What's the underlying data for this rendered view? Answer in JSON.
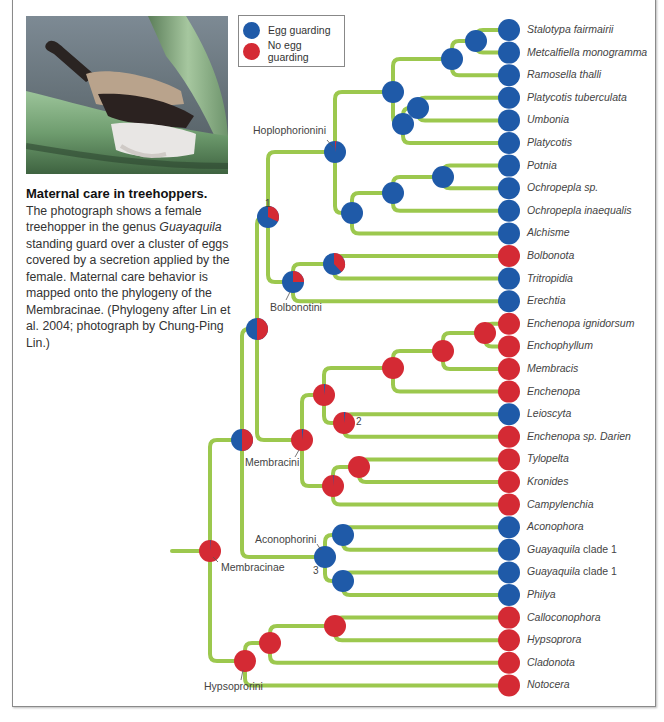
{
  "legend": {
    "items": [
      {
        "label": "Egg guarding",
        "color": "#1f5aa8"
      },
      {
        "label": "No egg guarding",
        "color": "#d42a34"
      }
    ]
  },
  "colors": {
    "egg_guarding": "#1f5aa8",
    "no_egg_guarding": "#d42a34",
    "branch": "#9cc84e"
  },
  "caption": {
    "title": "Maternal care in treehoppers.",
    "body_1": "The photograph shows a female treehopper in the genus ",
    "body_italic": "Guayaquila",
    "body_2": " standing guard over a cluster of eggs covered by a secretion applied by the female. Maternal care behavior is mapped onto the phylogeny of the Membracinae. (Phylogeny after Lin et al. 2004; photograph by Chung-Ping Lin.)"
  },
  "photo": {
    "description": "female treehopper guarding eggs on a green stem"
  },
  "clades": {
    "hoplophorionini": "Hoplophorionini",
    "bolbonotini": "Bolbonotini",
    "membracini": "Membracini",
    "aconophorini": "Aconophorini",
    "membracinae": "Membracinae",
    "hypsoprorini": "Hypsoprorini"
  },
  "node_numbers": {
    "n1": "1",
    "n2": "2",
    "n3": "3"
  },
  "taxa": [
    {
      "name": "Stalotypa fairmairii",
      "state": "egg_guarding"
    },
    {
      "name": "Metcalfiella monogramma",
      "state": "egg_guarding"
    },
    {
      "name": "Ramosella thalli",
      "state": "egg_guarding"
    },
    {
      "name": "Platycotis tuberculata",
      "state": "egg_guarding"
    },
    {
      "name": "Umbonia",
      "state": "egg_guarding"
    },
    {
      "name": "Platycotis",
      "state": "egg_guarding"
    },
    {
      "name": "Potnia",
      "state": "egg_guarding"
    },
    {
      "name": "Ochropepla sp.",
      "state": "egg_guarding"
    },
    {
      "name": "Ochropepla inaequalis",
      "state": "egg_guarding"
    },
    {
      "name": "Alchisme",
      "state": "egg_guarding"
    },
    {
      "name": "Bolbonota",
      "state": "no_egg_guarding"
    },
    {
      "name": "Tritropidia",
      "state": "egg_guarding"
    },
    {
      "name": "Erechtia",
      "state": "egg_guarding"
    },
    {
      "name": "Enchenopa ignidorsum",
      "state": "no_egg_guarding"
    },
    {
      "name": "Enchophyllum",
      "state": "no_egg_guarding"
    },
    {
      "name": "Membracis",
      "state": "no_egg_guarding"
    },
    {
      "name": "Enchenopa",
      "state": "no_egg_guarding"
    },
    {
      "name": "Leioscyta",
      "state": "egg_guarding"
    },
    {
      "name": "Enchenopa sp. Darien",
      "state": "no_egg_guarding"
    },
    {
      "name": "Tylopelta",
      "state": "no_egg_guarding"
    },
    {
      "name": "Kronides",
      "state": "no_egg_guarding"
    },
    {
      "name": "Campylenchia",
      "state": "no_egg_guarding"
    },
    {
      "name": "Aconophora",
      "state": "egg_guarding"
    },
    {
      "name": "Guayaquila",
      "suffix": " clade 1",
      "state": "egg_guarding"
    },
    {
      "name": "Guayaquila",
      "suffix": " clade 1",
      "state": "egg_guarding"
    },
    {
      "name": "Philya",
      "state": "egg_guarding"
    },
    {
      "name": "Calloconophora",
      "state": "no_egg_guarding"
    },
    {
      "name": "Hypsoprora",
      "state": "no_egg_guarding"
    },
    {
      "name": "Cladonota",
      "state": "no_egg_guarding"
    },
    {
      "name": "Notocera",
      "state": "no_egg_guarding"
    }
  ],
  "internal_nodes": [
    {
      "id": "stal_metc",
      "x": 476,
      "y": 41,
      "children": [
        "L0",
        "L1"
      ],
      "p_egg": 1.0
    },
    {
      "id": "ram",
      "x": 452,
      "y": 59,
      "children": [
        "stal_metc",
        "L2"
      ],
      "p_egg": 1.0
    },
    {
      "id": "platy_umb",
      "x": 418,
      "y": 108,
      "children": [
        "L3",
        "L4"
      ],
      "p_egg": 1.0
    },
    {
      "id": "platy",
      "x": 403,
      "y": 124,
      "children": [
        "platy_umb",
        "L5"
      ],
      "p_egg": 1.0
    },
    {
      "id": "hoplo_a",
      "x": 393,
      "y": 92,
      "children": [
        "ram",
        "platy"
      ],
      "p_egg": 1.0
    },
    {
      "id": "potnia",
      "x": 443,
      "y": 177,
      "children": [
        "L6",
        "L7"
      ],
      "p_egg": 1.0
    },
    {
      "id": "ochro",
      "x": 393,
      "y": 193,
      "children": [
        "potnia",
        "L8"
      ],
      "p_egg": 1.0
    },
    {
      "id": "alch",
      "x": 352,
      "y": 213,
      "children": [
        "ochro",
        "L9"
      ],
      "p_egg": 1.0
    },
    {
      "id": "hoplophorionini",
      "x": 335,
      "y": 152,
      "children": [
        "hoplo_a",
        "alch"
      ],
      "p_egg": 0.98
    },
    {
      "id": "bolb_trit",
      "x": 334,
      "y": 264,
      "children": [
        "L10",
        "L11"
      ],
      "p_egg": 0.62
    },
    {
      "id": "bolbonotini",
      "x": 293,
      "y": 282,
      "children": [
        "bolb_trit",
        "L12"
      ],
      "p_egg": 0.75
    },
    {
      "id": "n1",
      "x": 268,
      "y": 217,
      "children": [
        "hoplophorionini",
        "bolbonotini"
      ],
      "p_egg": 0.68
    },
    {
      "id": "ench_ign",
      "x": 485,
      "y": 333,
      "children": [
        "L13",
        "L14"
      ],
      "p_egg": 0.0
    },
    {
      "id": "memb",
      "x": 443,
      "y": 351,
      "children": [
        "ench_ign",
        "L15"
      ],
      "p_egg": 0.0
    },
    {
      "id": "ench",
      "x": 393,
      "y": 368,
      "children": [
        "memb",
        "L16"
      ],
      "p_egg": 0.0
    },
    {
      "id": "n2",
      "x": 344,
      "y": 423,
      "children": [
        "L17",
        "L18"
      ],
      "p_egg": 0.02
    },
    {
      "id": "memb_a",
      "x": 324,
      "y": 395,
      "children": [
        "ench",
        "n2"
      ],
      "p_egg": 0.02
    },
    {
      "id": "tylo",
      "x": 359,
      "y": 467,
      "children": [
        "L19",
        "L20"
      ],
      "p_egg": 0.0
    },
    {
      "id": "campy",
      "x": 333,
      "y": 486,
      "children": [
        "tylo",
        "L21"
      ],
      "p_egg": 0.01
    },
    {
      "id": "membracini",
      "x": 302,
      "y": 440,
      "children": [
        "memb_a",
        "campy"
      ],
      "p_egg": 0.02
    },
    {
      "id": "upper",
      "x": 257,
      "y": 329,
      "children": [
        "n1",
        "membracini"
      ],
      "p_egg": 0.5
    },
    {
      "id": "acono_a",
      "x": 343,
      "y": 535,
      "children": [
        "L22",
        "L23"
      ],
      "p_egg": 1.0
    },
    {
      "id": "acono_b",
      "x": 343,
      "y": 581,
      "children": [
        "L24",
        "L25"
      ],
      "p_egg": 1.0
    },
    {
      "id": "aconophorini",
      "x": 325,
      "y": 557,
      "children": [
        "acono_a",
        "acono_b"
      ],
      "p_egg": 1.0
    },
    {
      "id": "mid",
      "x": 242,
      "y": 440,
      "children": [
        "upper",
        "aconophorini"
      ],
      "p_egg": 0.5
    },
    {
      "id": "hyps_a",
      "x": 335,
      "y": 626,
      "children": [
        "L26",
        "L27"
      ],
      "p_egg": 0.0
    },
    {
      "id": "hyps_b",
      "x": 270,
      "y": 643,
      "children": [
        "hyps_a",
        "L28"
      ],
      "p_egg": 0.0
    },
    {
      "id": "hypsoprorini",
      "x": 245,
      "y": 661,
      "children": [
        "hyps_b",
        "L29"
      ],
      "p_egg": 0.0
    },
    {
      "id": "membracinae",
      "x": 210,
      "y": 551,
      "children": [
        "mid",
        "hypsoprorini"
      ],
      "p_egg": 0.01
    }
  ]
}
